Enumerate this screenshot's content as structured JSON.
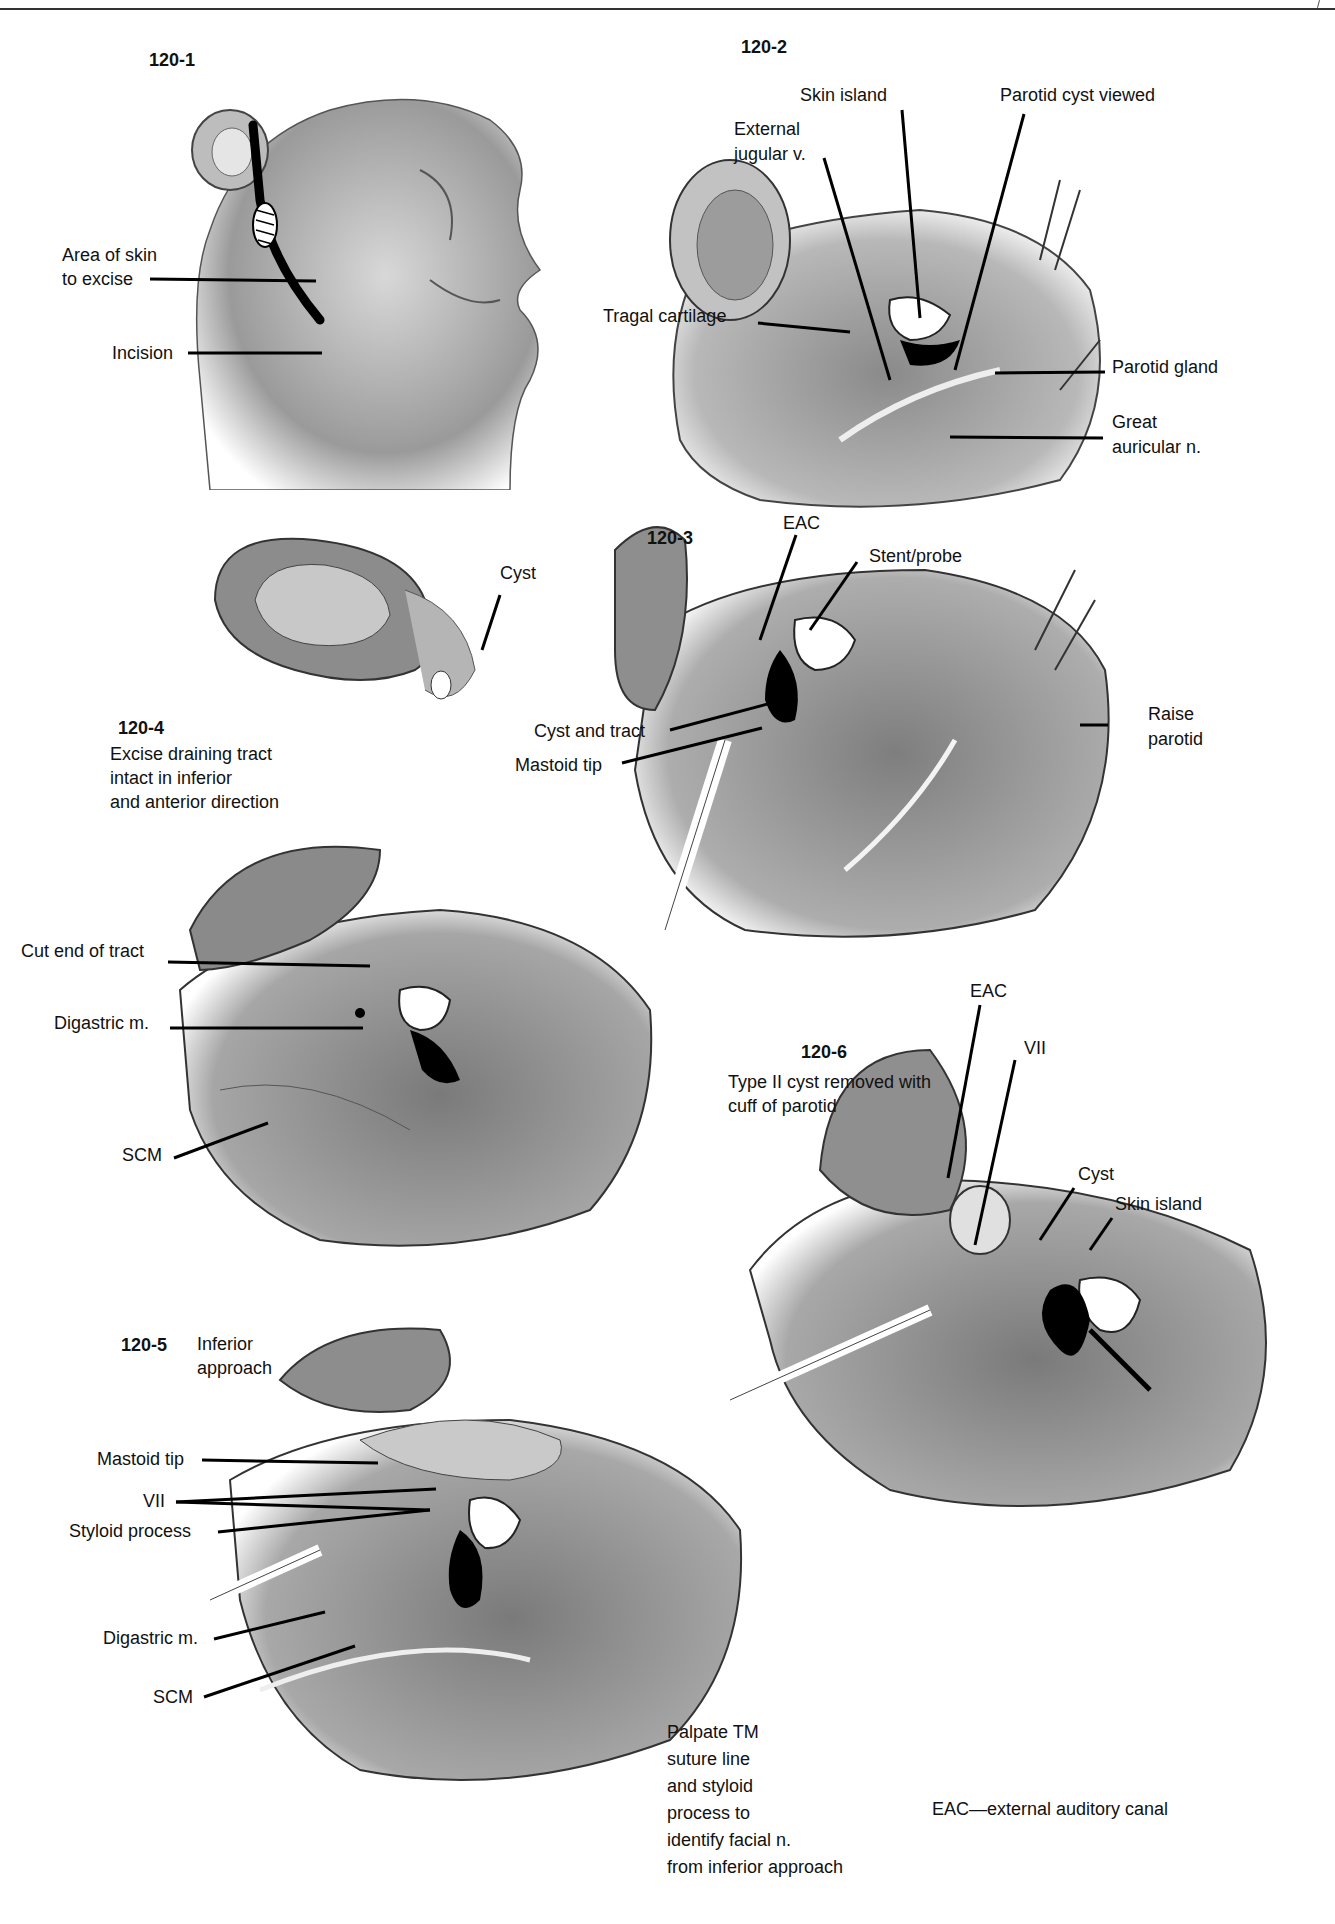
{
  "page": {
    "background": "#ffffff",
    "ink": "#111111",
    "footnote": "EAC—external auditory canal"
  },
  "figures": [
    {
      "id": "120-1",
      "number": "120-1",
      "labels": [
        "Area of skin",
        "to excise",
        "Incision"
      ]
    },
    {
      "id": "120-2",
      "number": "120-2",
      "labels": [
        "Skin island",
        "Parotid cyst viewed",
        "External",
        "jugular v.",
        "Tragal cartilage",
        "Parotid gland",
        "Great",
        "auricular n."
      ]
    },
    {
      "id": "120-3",
      "number": "120-3",
      "labels": [
        "Cyst",
        "EAC",
        "Stent/probe",
        "Cyst and tract",
        "Mastoid tip",
        "Raise",
        "parotid"
      ]
    },
    {
      "id": "120-4",
      "number": "120-4",
      "caption": [
        "Excise draining tract",
        "intact in inferior",
        "and anterior direction"
      ],
      "labels": [
        "Cut end of tract",
        "Digastric m.",
        "SCM"
      ]
    },
    {
      "id": "120-5",
      "number": "120-5",
      "caption": [
        "Inferior",
        "approach"
      ],
      "labels": [
        "Mastoid tip",
        "VII",
        "Styloid process",
        "Digastric m.",
        "SCM"
      ],
      "note": [
        "Palpate TM",
        "suture line",
        "and styloid",
        "process to",
        "identify facial n.",
        "from inferior approach"
      ]
    },
    {
      "id": "120-6",
      "number": "120-6",
      "caption": [
        "Type II cyst removed with",
        "cuff of parotid"
      ],
      "labels": [
        "EAC",
        "VII",
        "Cyst",
        "Skin island"
      ]
    }
  ]
}
